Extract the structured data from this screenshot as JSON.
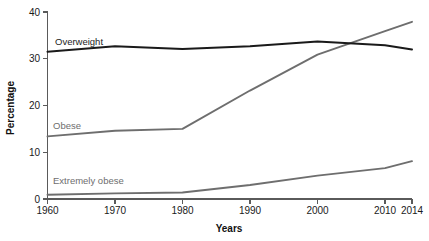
{
  "chart_data": {
    "type": "line",
    "title": "",
    "xlabel": "Years",
    "ylabel": "Percentage",
    "xlim": [
      1960,
      2014
    ],
    "ylim": [
      0,
      40
    ],
    "grid": false,
    "legend_position": "inline-labels",
    "xticks": [
      1960,
      1970,
      1980,
      1990,
      2000,
      2010,
      2014
    ],
    "xtick_labels": [
      "1960",
      "1970",
      "1980",
      "1990",
      "2000",
      "2010",
      "2014"
    ],
    "yticks": [
      0,
      10,
      20,
      30,
      40
    ],
    "ytick_labels": [
      "0",
      "10",
      "20",
      "30",
      "40"
    ],
    "x": [
      1960,
      1970,
      1980,
      1990,
      2000,
      2010,
      2014
    ],
    "series": [
      {
        "name": "Overweight",
        "color": "#1a1a1a",
        "label_text": "Overweight",
        "values": [
          31.5,
          32.7,
          32.1,
          32.7,
          33.7,
          32.9,
          32.0
        ]
      },
      {
        "name": "Obese",
        "color": "#6e6e6e",
        "label_text": "Obese",
        "values": [
          13.4,
          14.6,
          15.0,
          23.2,
          30.9,
          35.9,
          37.9
        ]
      },
      {
        "name": "Extremely obese",
        "color": "#6e6e6e",
        "label_text": "Extremely obese",
        "values": [
          0.9,
          1.2,
          1.4,
          3.0,
          5.0,
          6.6,
          8.1
        ]
      }
    ],
    "annotations": [
      {
        "text": "Overweight",
        "series": "Overweight",
        "at_year": 1963,
        "at_value": 34.6
      },
      {
        "text": "Obese",
        "series": "Obese",
        "at_year": 1962,
        "at_value": 16.6
      },
      {
        "text": "Extremely obese",
        "series": "Extremely obese",
        "at_year": 1962,
        "at_value": 3.1
      }
    ]
  }
}
